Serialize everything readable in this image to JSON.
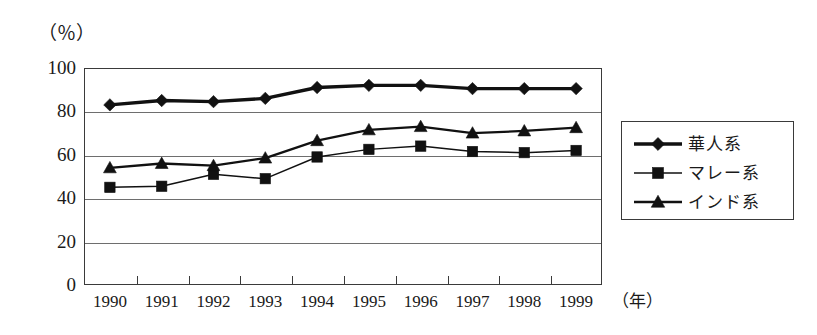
{
  "chart_data": {
    "type": "line",
    "title": "",
    "subtitle": "",
    "xlabel": "（年）",
    "ylabel": "（％）",
    "ylim": [
      0,
      100
    ],
    "yticks": [
      0,
      20,
      40,
      60,
      80,
      100
    ],
    "ytick_labels": [
      "0",
      "20",
      "40",
      "60",
      "80",
      "100"
    ],
    "grid": true,
    "legend_position": "right",
    "categories": [
      "1990",
      "1991",
      "1992",
      "1993",
      "1994",
      "1995",
      "1996",
      "1997",
      "1998",
      "1999"
    ],
    "series": [
      {
        "name": "華人系",
        "marker": "diamond",
        "values": [
          83,
          85,
          84.5,
          86,
          91,
          92,
          92,
          90.5,
          90.5,
          90.5
        ]
      },
      {
        "name": "マレー系",
        "marker": "square",
        "values": [
          45,
          45.5,
          51,
          49,
          59,
          62.5,
          64,
          61.5,
          61,
          62
        ]
      },
      {
        "name": "インド系",
        "marker": "triangle",
        "values": [
          54,
          56,
          55,
          58.5,
          66.5,
          71.5,
          73,
          70,
          71,
          72.5
        ]
      }
    ]
  },
  "axis": {
    "y_unit_label": "（％）",
    "x_unit_label": "（年）"
  },
  "legend": {
    "items": [
      {
        "label": "華人系",
        "marker": "diamond-marker-icon"
      },
      {
        "label": "マレー系",
        "marker": "square-marker-icon"
      },
      {
        "label": "インド系",
        "marker": "triangle-marker-icon"
      }
    ]
  },
  "colors": {
    "line": "#111111",
    "frame": "#3a3a3a",
    "grid": "#6e6e6e",
    "background": "#ffffff",
    "text": "#1a1a1a"
  }
}
